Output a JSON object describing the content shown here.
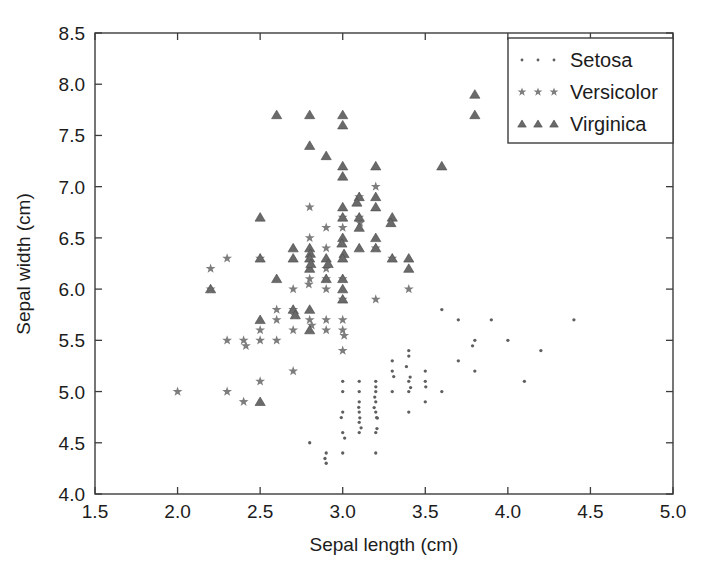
{
  "chart_data": {
    "type": "scatter",
    "title": "",
    "xlabel": "Sepal length (cm)",
    "ylabel": "Sepal width (cm)",
    "xlim": [
      1.5,
      5.0
    ],
    "ylim": [
      4.0,
      8.5
    ],
    "xticks": [
      "1.5",
      "2.0",
      "2.5",
      "3.0",
      "3.5",
      "4.0",
      "4.5",
      "5.0"
    ],
    "yticks": [
      "4.0",
      "4.5",
      "5.0",
      "5.5",
      "6.0",
      "6.5",
      "7.0",
      "7.5",
      "8.0",
      "8.5"
    ],
    "xtick_values": [
      1.5,
      2.0,
      2.5,
      3.0,
      3.5,
      4.0,
      4.5,
      5.0
    ],
    "ytick_values": [
      4.0,
      4.5,
      5.0,
      5.5,
      6.0,
      6.5,
      7.0,
      7.5,
      8.0,
      8.5
    ],
    "grid": false,
    "legend_position": "top-right",
    "marker_color": "#6b6b6b",
    "axis_color": "#3c3c3c",
    "series": [
      {
        "name": "Setosa",
        "marker": "dot",
        "points": [
          [
            3.0,
            5.1
          ],
          [
            3.2,
            4.9
          ],
          [
            3.1,
            4.7
          ],
          [
            3.0,
            4.6
          ],
          [
            3.2,
            5.0
          ],
          [
            3.4,
            5.4
          ],
          [
            3.1,
            4.6
          ],
          [
            3.2,
            5.0
          ],
          [
            2.9,
            4.4
          ],
          [
            3.1,
            4.9
          ],
          [
            3.4,
            5.4
          ],
          [
            3.2,
            4.8
          ],
          [
            3.0,
            4.8
          ],
          [
            2.9,
            4.3
          ],
          [
            3.6,
            5.8
          ],
          [
            3.9,
            5.7
          ],
          [
            3.4,
            5.4
          ],
          [
            3.2,
            5.1
          ],
          [
            3.7,
            5.7
          ],
          [
            3.5,
            5.1
          ],
          [
            3.4,
            5.4
          ],
          [
            3.5,
            5.1
          ],
          [
            3.2,
            4.6
          ],
          [
            3.1,
            5.1
          ],
          [
            3.2,
            4.8
          ],
          [
            3.2,
            5.0
          ],
          [
            3.2,
            5.0
          ],
          [
            3.3,
            5.2
          ],
          [
            3.3,
            5.2
          ],
          [
            3.1,
            4.7
          ],
          [
            3.0,
            4.8
          ],
          [
            3.4,
            5.4
          ],
          [
            3.8,
            5.2
          ],
          [
            3.8,
            5.5
          ],
          [
            3.1,
            4.9
          ],
          [
            3.2,
            5.0
          ],
          [
            3.8,
            5.5
          ],
          [
            3.1,
            4.9
          ],
          [
            2.9,
            4.4
          ],
          [
            3.2,
            5.1
          ],
          [
            3.1,
            5.0
          ],
          [
            2.8,
            4.5
          ],
          [
            3.2,
            4.4
          ],
          [
            3.4,
            5.0
          ],
          [
            4.1,
            5.1
          ],
          [
            3.1,
            4.8
          ],
          [
            3.4,
            5.1
          ],
          [
            3.0,
            4.6
          ],
          [
            3.3,
            5.3
          ],
          [
            3.0,
            5.0
          ],
          [
            4.4,
            5.7
          ],
          [
            4.2,
            5.4
          ],
          [
            4.0,
            5.5
          ],
          [
            3.7,
            5.3
          ],
          [
            3.6,
            5.0
          ],
          [
            3.5,
            5.2
          ],
          [
            3.5,
            4.9
          ],
          [
            3.4,
            4.8
          ],
          [
            3.3,
            5.0
          ],
          [
            3.0,
            4.4
          ]
        ]
      },
      {
        "name": "Versicolor",
        "marker": "star",
        "points": [
          [
            3.2,
            7.0
          ],
          [
            3.2,
            6.4
          ],
          [
            3.1,
            6.9
          ],
          [
            2.3,
            5.5
          ],
          [
            2.8,
            6.5
          ],
          [
            2.8,
            5.7
          ],
          [
            3.3,
            6.3
          ],
          [
            2.4,
            4.9
          ],
          [
            2.9,
            6.6
          ],
          [
            2.7,
            5.2
          ],
          [
            2.0,
            5.0
          ],
          [
            3.0,
            5.9
          ],
          [
            2.2,
            6.0
          ],
          [
            2.9,
            6.1
          ],
          [
            2.9,
            5.6
          ],
          [
            3.1,
            6.7
          ],
          [
            3.0,
            5.6
          ],
          [
            2.7,
            5.8
          ],
          [
            2.2,
            6.2
          ],
          [
            2.5,
            5.6
          ],
          [
            3.2,
            5.9
          ],
          [
            2.8,
            6.1
          ],
          [
            2.5,
            6.3
          ],
          [
            2.8,
            6.1
          ],
          [
            2.9,
            6.4
          ],
          [
            3.0,
            6.6
          ],
          [
            2.8,
            6.8
          ],
          [
            3.0,
            6.7
          ],
          [
            2.9,
            6.0
          ],
          [
            2.6,
            5.7
          ],
          [
            2.4,
            5.5
          ],
          [
            2.4,
            5.5
          ],
          [
            2.7,
            5.8
          ],
          [
            2.7,
            6.0
          ],
          [
            3.0,
            5.4
          ],
          [
            3.4,
            6.0
          ],
          [
            3.1,
            6.7
          ],
          [
            2.3,
            6.3
          ],
          [
            3.0,
            5.6
          ],
          [
            2.5,
            5.5
          ],
          [
            2.6,
            5.5
          ],
          [
            3.0,
            6.1
          ],
          [
            2.6,
            5.8
          ],
          [
            2.3,
            5.0
          ],
          [
            2.7,
            5.6
          ],
          [
            3.0,
            5.7
          ],
          [
            2.9,
            5.7
          ],
          [
            2.9,
            6.2
          ],
          [
            2.5,
            5.1
          ],
          [
            2.8,
            5.7
          ]
        ]
      },
      {
        "name": "Virginica",
        "marker": "triangle",
        "points": [
          [
            3.3,
            6.3
          ],
          [
            2.7,
            5.8
          ],
          [
            3.0,
            7.1
          ],
          [
            2.9,
            6.3
          ],
          [
            3.0,
            6.5
          ],
          [
            3.0,
            7.6
          ],
          [
            2.5,
            4.9
          ],
          [
            2.9,
            7.3
          ],
          [
            2.5,
            6.7
          ],
          [
            3.6,
            7.2
          ],
          [
            3.2,
            6.5
          ],
          [
            2.7,
            6.4
          ],
          [
            3.0,
            6.8
          ],
          [
            2.5,
            5.7
          ],
          [
            2.8,
            5.8
          ],
          [
            3.2,
            6.4
          ],
          [
            3.0,
            6.5
          ],
          [
            3.8,
            7.7
          ],
          [
            2.6,
            7.7
          ],
          [
            2.2,
            6.0
          ],
          [
            3.2,
            6.9
          ],
          [
            2.8,
            5.6
          ],
          [
            2.8,
            7.7
          ],
          [
            2.7,
            6.3
          ],
          [
            3.3,
            6.7
          ],
          [
            3.2,
            7.2
          ],
          [
            2.8,
            6.2
          ],
          [
            3.0,
            6.1
          ],
          [
            2.8,
            6.4
          ],
          [
            3.0,
            7.2
          ],
          [
            2.8,
            7.4
          ],
          [
            3.8,
            7.9
          ],
          [
            2.8,
            6.4
          ],
          [
            2.8,
            6.3
          ],
          [
            2.6,
            6.1
          ],
          [
            3.0,
            7.7
          ],
          [
            3.4,
            6.3
          ],
          [
            3.1,
            6.4
          ],
          [
            3.0,
            6.0
          ],
          [
            3.1,
            6.9
          ],
          [
            3.1,
            6.7
          ],
          [
            3.1,
            6.9
          ],
          [
            2.7,
            5.8
          ],
          [
            3.2,
            6.8
          ],
          [
            3.3,
            6.7
          ],
          [
            3.0,
            6.7
          ],
          [
            2.5,
            6.3
          ],
          [
            3.0,
            6.5
          ],
          [
            3.4,
            6.2
          ],
          [
            3.0,
            5.9
          ],
          [
            2.8,
            6.3
          ],
          [
            2.9,
            6.3
          ],
          [
            3.0,
            6.3
          ],
          [
            3.1,
            6.6
          ],
          [
            2.9,
            6.1
          ]
        ]
      }
    ]
  },
  "legend": {
    "entries": [
      {
        "label": "Setosa",
        "marker": "dot"
      },
      {
        "label": "Versicolor",
        "marker": "star"
      },
      {
        "label": "Virginica",
        "marker": "triangle"
      }
    ]
  },
  "axes": {
    "x_title": "Sepal length (cm)",
    "y_title": "Sepal width (cm)"
  }
}
